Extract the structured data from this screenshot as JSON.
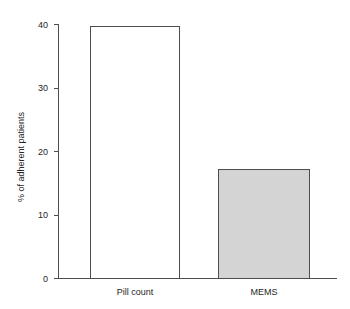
{
  "chart_data": {
    "type": "bar",
    "title": "",
    "subtitle": "",
    "xlabel": "",
    "ylabel": "% of adherent patients",
    "categories": [
      "Pill count",
      "MEMS"
    ],
    "values": [
      39.7,
      17.2
    ],
    "series": [
      {
        "name": "% of adherent patients",
        "values": [
          39.7,
          17.2
        ]
      }
    ],
    "ylim": [
      0,
      40
    ],
    "yticks": [
      0,
      10,
      20,
      30,
      40
    ],
    "ytick_labels": [
      "0",
      "10",
      "20",
      "30",
      "40"
    ],
    "grid": false,
    "legend": false,
    "legend_position": "none",
    "bar_colors": [
      "#ffffff",
      "#d4d4d4"
    ],
    "bar_edge_color": "#4d4d4d",
    "axis_color": "#4d4d4d",
    "background": "#ffffff",
    "annotations": []
  },
  "axis": {
    "y_title": "% of adherent patients"
  }
}
